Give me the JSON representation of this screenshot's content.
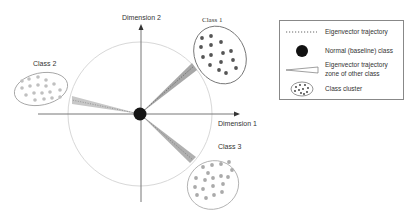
{
  "diagram": {
    "axes": {
      "x_label": "Dimension 1",
      "y_label": "Dimension 2"
    },
    "classes": [
      {
        "id": "class1",
        "label": "Class 1",
        "color": "#555555"
      },
      {
        "id": "class2",
        "label": "Class 2",
        "color": "#b0b0b0"
      },
      {
        "id": "class3",
        "label": "Class 3",
        "color": "#a0a0a0"
      }
    ],
    "center": {
      "label": "Normal (baseline) class",
      "color": "#111111"
    },
    "legend": {
      "items": [
        {
          "icon": "dotted-line-icon",
          "label": "Eigenvector trajectory"
        },
        {
          "icon": "black-circle-icon",
          "label": "Normal (baseline) class"
        },
        {
          "icon": "wedge-icon",
          "label": "Eigenvector trajectory zone of other class",
          "line1": "Eigenvector trajectory",
          "line2": "zone of other class"
        },
        {
          "icon": "cluster-icon",
          "label": "Class cluster"
        }
      ]
    }
  }
}
